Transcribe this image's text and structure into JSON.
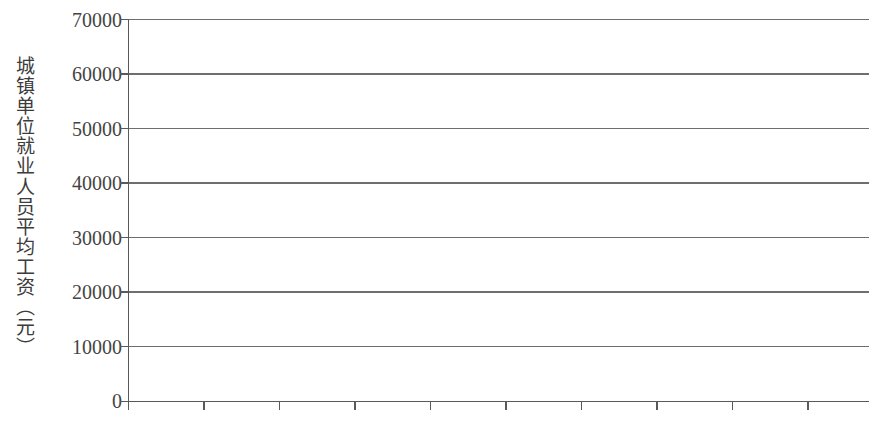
{
  "chart_data": {
    "type": "line",
    "title": "",
    "xlabel": "",
    "ylabel": "城镇单位就业人员平均工资（元）",
    "categories": [
      "2006年",
      "2007年",
      "2008年",
      "2009年",
      "2010年",
      "2011年",
      "2012年",
      "2013年",
      "2014年",
      "2015年"
    ],
    "series": [
      {
        "name": "城镇单位就业人员平均工资",
        "values": [
          21000,
          25500,
          29500,
          34000,
          38000,
          42500,
          47000,
          51500,
          56500,
          61600
        ]
      }
    ],
    "ylim": [
      0,
      70000
    ],
    "y_ticks": [
      0,
      10000,
      20000,
      30000,
      40000,
      50000,
      60000,
      70000
    ],
    "y_tick_labels": [
      "0",
      "10000",
      "20000",
      "30000",
      "40000",
      "50000",
      "60000",
      "70000"
    ],
    "grid": true,
    "grid_axis": "y",
    "legend": false,
    "legend_position": "none",
    "line_color": "#6b6b6b",
    "axis_color": "#595959",
    "grid_color": "#6e6e6e",
    "background_color": "#ffffff"
  },
  "axes": {
    "y_title": "城镇单位就业人员平均工资（元）"
  }
}
